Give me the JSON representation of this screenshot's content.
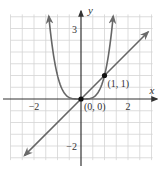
{
  "chart_data": {
    "type": "line",
    "title": "",
    "xlabel": "x",
    "ylabel": "y",
    "xlim": [
      -3.0,
      3.1
    ],
    "ylim": [
      -2.7,
      3.6
    ],
    "grid": true,
    "grid_step": 0.5,
    "x_ticks": [
      {
        "value": -2,
        "label": "−2"
      },
      {
        "value": 2,
        "label": "2"
      }
    ],
    "y_ticks": [
      {
        "value": 3,
        "label": "3"
      },
      {
        "value": -2,
        "label": "−2"
      }
    ],
    "series": [
      {
        "name": "y = x^4",
        "kind": "curve",
        "function": "x^4",
        "x_range": [
          -1.37,
          1.37
        ],
        "color": "#666666"
      },
      {
        "name": "y = x",
        "kind": "line",
        "function": "x",
        "x_range": [
          -2.4,
          2.85
        ],
        "color": "#666666"
      }
    ],
    "points": [
      {
        "x": 0,
        "y": 0,
        "label": "(0, 0)"
      },
      {
        "x": 1,
        "y": 1,
        "label": "(1, 1)"
      }
    ]
  },
  "colors": {
    "grid": "#d4d4d4",
    "axis": "#333333",
    "curve": "#6a6a6a",
    "point": "#111111"
  }
}
